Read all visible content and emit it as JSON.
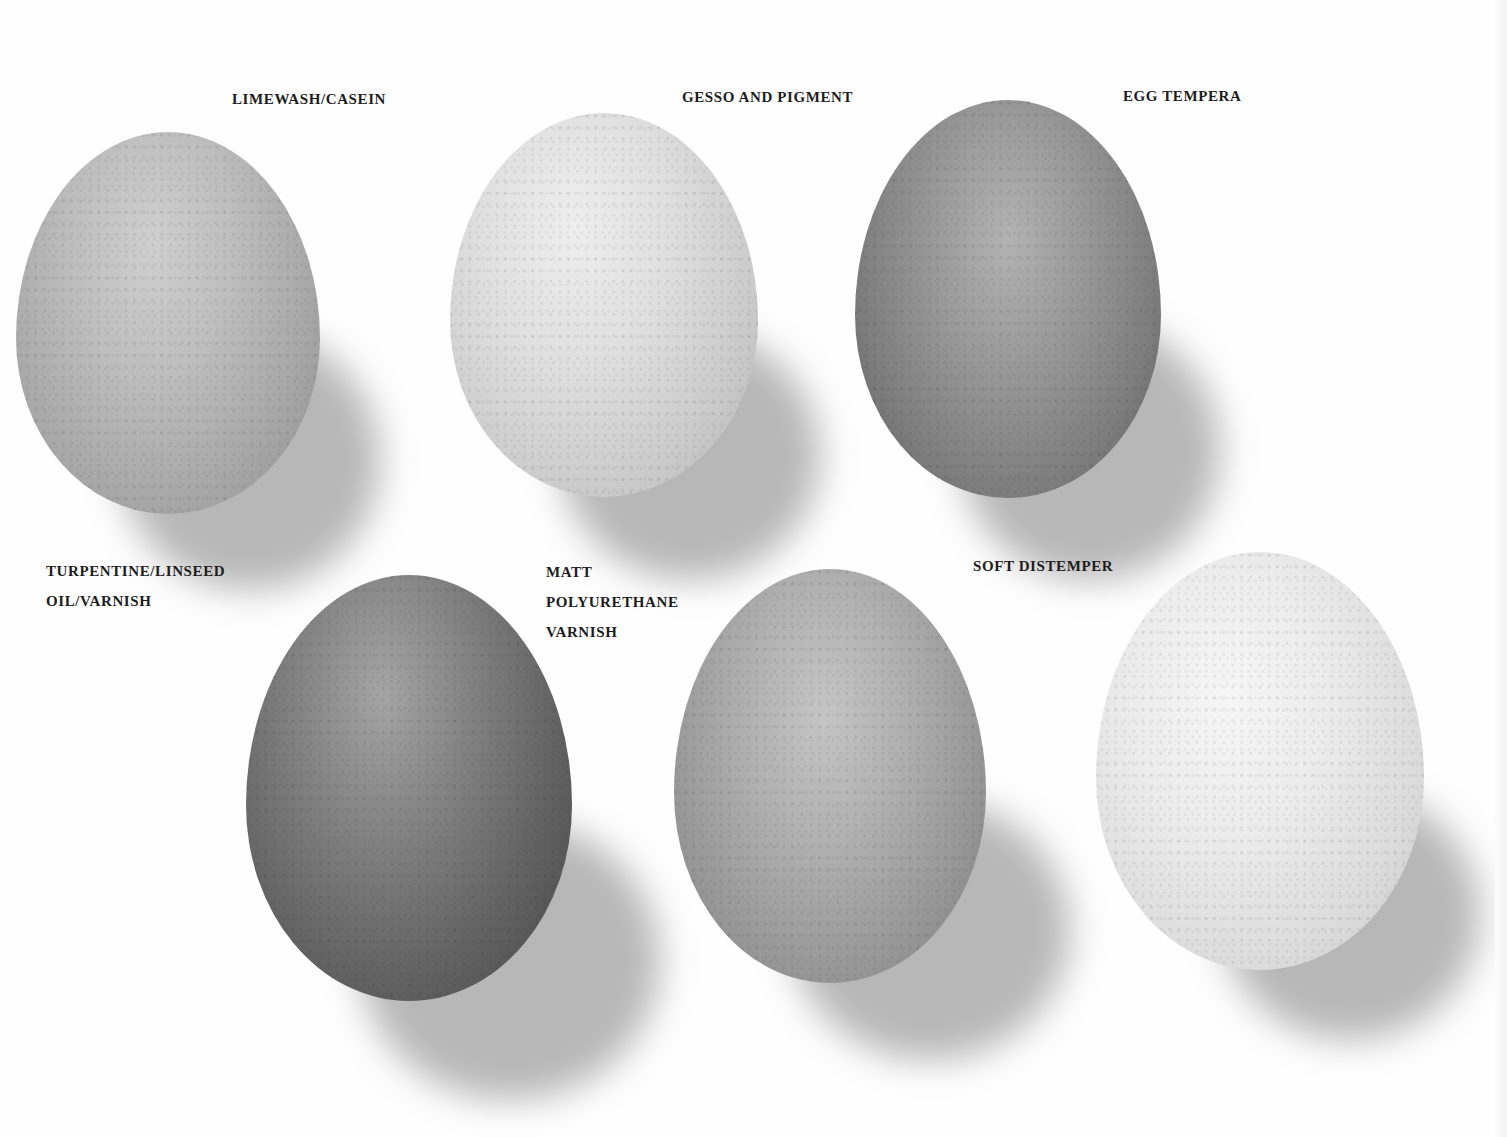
{
  "page": {
    "background": "#fefefe"
  },
  "captions": [
    {
      "id": "limewash",
      "text": "LIMEWASH/CASEIN"
    },
    {
      "id": "gesso",
      "text": "GESSO AND PIGMENT"
    },
    {
      "id": "egg-tempera",
      "text": "EGG TEMPERA"
    },
    {
      "id": "turpentine",
      "text": "TURPENTINE/LINSEED\nOIL/VARNISH"
    },
    {
      "id": "matt-polyurethane",
      "text": "MATT\nPOLYURETHANE\nVARNISH"
    },
    {
      "id": "soft-distemper",
      "text": "SOFT DISTEMPER"
    }
  ],
  "eggs": [
    {
      "id": "limewash-egg",
      "finish": "LIMEWASH/CASEIN",
      "tone": "mid-light grey, speckled"
    },
    {
      "id": "gesso-egg",
      "finish": "GESSO AND PIGMENT",
      "tone": "light grey, smooth chalky"
    },
    {
      "id": "egg-tempera-egg",
      "finish": "EGG TEMPERA",
      "tone": "mid-dark grey, streaked"
    },
    {
      "id": "turpentine-egg",
      "finish": "TURPENTINE/LINSEED OIL/VARNISH",
      "tone": "dark grey, heavily speckled"
    },
    {
      "id": "matt-polyurethane-egg",
      "finish": "MATT POLYURETHANE VARNISH",
      "tone": "mid grey, mottled"
    },
    {
      "id": "soft-distemper-egg",
      "finish": "SOFT DISTEMPER",
      "tone": "very light, near white"
    }
  ]
}
